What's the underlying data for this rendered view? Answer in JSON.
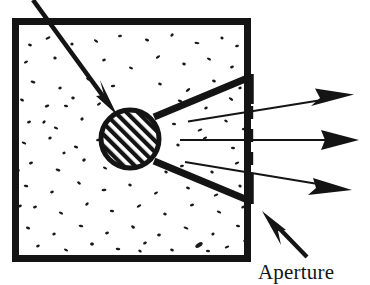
{
  "figure": {
    "ink_color": "#141414",
    "background_color": "#ffffff",
    "width": 370,
    "height": 285
  },
  "labels": {
    "aperture": "Aperture"
  },
  "elements": {
    "sample_box": {
      "name": "speckled-medium-box",
      "x": 12,
      "y": 18,
      "width": 239,
      "height": 244,
      "wall_thickness": 7,
      "fill": "#ffffff",
      "texture": "speckle"
    },
    "scatterer": {
      "name": "hatched-scatterer-circle",
      "cx": 130,
      "cy": 139,
      "r": 31,
      "ring_thickness": 5,
      "hatch_angle_deg": 45,
      "hatch_spacing": 8
    },
    "incident_ray": {
      "name": "incident-ray-arrow",
      "from_x": 33,
      "from_y": 0,
      "to_x": 116,
      "to_y": 113,
      "thickness": 4.6,
      "arrowhead": "solid-barbed"
    },
    "collimator_upper_arm": {
      "name": "collimator-upper-arm",
      "from_x": 154,
      "from_y": 117,
      "to_x": 250,
      "to_y": 77,
      "thickness": 7
    },
    "collimator_lower_arm": {
      "name": "collimator-lower-arm",
      "from_x": 154,
      "from_y": 161,
      "to_x": 250,
      "to_y": 201,
      "thickness": 7
    },
    "aperture_slit": {
      "name": "aperture-dashed-slit",
      "x": 251,
      "top_y": 74,
      "bottom_y": 204,
      "dash_on": 13,
      "dash_off": 10,
      "thickness": 3.4,
      "jaw_thickness": 4.5
    },
    "scattered_rays": [
      {
        "name": "scattered-ray-upper",
        "from_x": 188,
        "from_y": 121,
        "to_x": 352,
        "to_y": 95,
        "thickness": 2.1
      },
      {
        "name": "scattered-ray-middle",
        "from_x": 180,
        "from_y": 140,
        "to_x": 358,
        "to_y": 140,
        "thickness": 2.0
      },
      {
        "name": "scattered-ray-lower",
        "from_x": 185,
        "from_y": 162,
        "to_x": 350,
        "to_y": 190,
        "thickness": 2.1
      }
    ],
    "aperture_pointer": {
      "name": "aperture-pointer-arrow",
      "from_x": 307,
      "from_y": 257,
      "to_x": 263,
      "to_y": 212,
      "thickness": 4.2
    },
    "aperture_label_position": {
      "x": 258,
      "y": 279
    }
  },
  "speckles": [
    [
      30,
      45,
      2.0,
      1.3,
      18
    ],
    [
      48,
      38,
      2.6,
      1.2,
      -25
    ],
    [
      72,
      44,
      1.6,
      1.5,
      0
    ],
    [
      96,
      41,
      2.4,
      1.1,
      35
    ],
    [
      120,
      36,
      2.0,
      1.2,
      -10
    ],
    [
      147,
      40,
      2.2,
      1.3,
      20
    ],
    [
      172,
      35,
      1.8,
      1.4,
      -40
    ],
    [
      197,
      43,
      2.5,
      1.1,
      8
    ],
    [
      222,
      38,
      1.7,
      1.4,
      30
    ],
    [
      237,
      46,
      2.0,
      1.2,
      -18
    ],
    [
      26,
      62,
      2.2,
      1.2,
      -30
    ],
    [
      55,
      58,
      1.7,
      1.5,
      12
    ],
    [
      81,
      66,
      2.6,
      1.2,
      40
    ],
    [
      104,
      60,
      1.9,
      1.3,
      -15
    ],
    [
      131,
      68,
      2.1,
      1.2,
      22
    ],
    [
      158,
      57,
      2.4,
      1.2,
      -35
    ],
    [
      184,
      64,
      1.8,
      1.4,
      5
    ],
    [
      209,
      59,
      2.2,
      1.2,
      28
    ],
    [
      232,
      67,
      2.0,
      1.3,
      -20
    ],
    [
      33,
      82,
      2.5,
      1.2,
      15
    ],
    [
      60,
      88,
      1.8,
      1.4,
      -28
    ],
    [
      88,
      79,
      2.1,
      1.3,
      33
    ],
    [
      113,
      86,
      2.3,
      1.2,
      -5
    ],
    [
      160,
      84,
      1.9,
      1.3,
      18
    ],
    [
      188,
      90,
      2.6,
      1.2,
      -38
    ],
    [
      214,
      81,
      2.0,
      1.4,
      25
    ],
    [
      240,
      88,
      1.7,
      1.4,
      -12
    ],
    [
      22,
      100,
      2.1,
      1.3,
      27
    ],
    [
      47,
      106,
      2.4,
      1.2,
      -20
    ],
    [
      73,
      98,
      1.8,
      1.4,
      10
    ],
    [
      99,
      104,
      2.2,
      1.2,
      -32
    ],
    [
      180,
      101,
      2.3,
      1.2,
      16
    ],
    [
      206,
      108,
      1.9,
      1.3,
      -26
    ],
    [
      231,
      99,
      2.5,
      1.2,
      36
    ],
    [
      29,
      122,
      2.0,
      1.3,
      -14
    ],
    [
      56,
      128,
      2.3,
      1.2,
      21
    ],
    [
      82,
      119,
      1.7,
      1.5,
      -36
    ],
    [
      174,
      124,
      2.1,
      1.3,
      9
    ],
    [
      200,
      130,
      2.5,
      1.2,
      -22
    ],
    [
      226,
      121,
      1.9,
      1.3,
      31
    ],
    [
      244,
      129,
      2.2,
      1.2,
      -8
    ],
    [
      24,
      143,
      2.4,
      1.2,
      24
    ],
    [
      50,
      138,
      1.8,
      1.4,
      -30
    ],
    [
      76,
      147,
      2.2,
      1.3,
      13
    ],
    [
      98,
      140,
      2.0,
      1.2,
      -17
    ],
    [
      178,
      145,
      1.8,
      1.4,
      29
    ],
    [
      205,
      138,
      2.3,
      1.2,
      -24
    ],
    [
      233,
      148,
      2.1,
      1.3,
      6
    ],
    [
      31,
      163,
      2.1,
      1.3,
      -21
    ],
    [
      58,
      170,
      2.5,
      1.2,
      17
    ],
    [
      84,
      160,
      1.9,
      1.4,
      -34
    ],
    [
      105,
      168,
      2.2,
      1.2,
      26
    ],
    [
      182,
      166,
      2.0,
      1.3,
      -11
    ],
    [
      212,
      172,
      1.8,
      1.4,
      32
    ],
    [
      237,
      163,
      2.4,
      1.2,
      -27
    ],
    [
      26,
      186,
      2.3,
      1.2,
      11
    ],
    [
      52,
      192,
      1.9,
      1.3,
      -19
    ],
    [
      79,
      183,
      2.1,
      1.3,
      37
    ],
    [
      104,
      190,
      2.5,
      1.2,
      -6
    ],
    [
      130,
      185,
      1.8,
      1.4,
      23
    ],
    [
      156,
      193,
      2.2,
      1.2,
      -31
    ],
    [
      188,
      188,
      2.0,
      1.3,
      14
    ],
    [
      216,
      195,
      2.4,
      1.2,
      -23
    ],
    [
      240,
      186,
      1.7,
      1.4,
      34
    ],
    [
      35,
      207,
      2.0,
      1.3,
      -16
    ],
    [
      61,
      213,
      2.3,
      1.2,
      28
    ],
    [
      87,
      204,
      1.9,
      1.4,
      -37
    ],
    [
      112,
      211,
      2.2,
      1.2,
      7
    ],
    [
      139,
      206,
      2.5,
      1.2,
      -29
    ],
    [
      165,
      214,
      1.8,
      1.4,
      19
    ],
    [
      192,
      205,
      2.1,
      1.3,
      -13
    ],
    [
      219,
      212,
      2.3,
      1.2,
      25
    ],
    [
      243,
      207,
      1.9,
      1.3,
      -35
    ],
    [
      28,
      228,
      2.2,
      1.2,
      20
    ],
    [
      54,
      234,
      1.8,
      1.4,
      -27
    ],
    [
      81,
      226,
      2.4,
      1.2,
      12
    ],
    [
      107,
      233,
      2.0,
      1.3,
      -18
    ],
    [
      133,
      227,
      2.1,
      1.3,
      30
    ],
    [
      159,
      235,
      1.9,
      1.4,
      -9
    ],
    [
      186,
      228,
      2.6,
      1.2,
      22
    ],
    [
      213,
      234,
      1.7,
      1.4,
      -33
    ],
    [
      238,
      226,
      2.2,
      1.2,
      15
    ],
    [
      38,
      246,
      1.9,
      1.3,
      -22
    ],
    [
      66,
      250,
      2.2,
      1.2,
      26
    ],
    [
      92,
      244,
      1.8,
      1.4,
      -14
    ],
    [
      118,
      249,
      2.3,
      1.2,
      8
    ],
    [
      145,
      243,
      2.0,
      1.3,
      -30
    ],
    [
      172,
      250,
      1.9,
      1.3,
      18
    ],
    [
      199,
      245,
      4.2,
      2.0,
      -34
    ],
    [
      208,
      251,
      2.1,
      1.3,
      10
    ],
    [
      227,
      247,
      2.4,
      1.2,
      -25
    ],
    [
      245,
      241,
      1.8,
      1.4,
      29
    ],
    [
      44,
      122,
      1.9,
      1.3,
      -40
    ],
    [
      66,
      106,
      2.2,
      1.2,
      14
    ],
    [
      92,
      244,
      1.7,
      1.4,
      22
    ],
    [
      246,
      112,
      1.8,
      1.3,
      -16
    ],
    [
      18,
      170,
      1.9,
      1.3,
      30
    ],
    [
      20,
      206,
      2.0,
      1.3,
      -24
    ],
    [
      246,
      168,
      2.1,
      1.2,
      19
    ],
    [
      166,
      111,
      1.7,
      1.4,
      -28
    ],
    [
      166,
      172,
      1.8,
      1.3,
      24
    ],
    [
      64,
      153,
      1.6,
      1.4,
      -12
    ],
    [
      140,
      251,
      1.9,
      1.3,
      35
    ]
  ]
}
